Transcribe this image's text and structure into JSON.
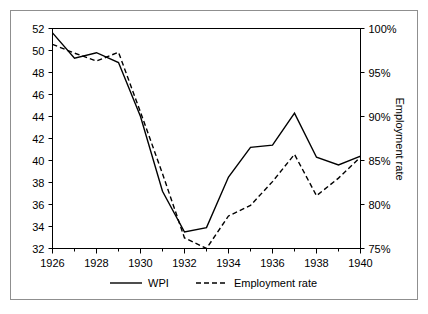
{
  "chart_data": {
    "type": "line",
    "title": "",
    "subtitle": "",
    "xlabel": "",
    "ylabel": "",
    "y2label": "Employment rate",
    "grid": false,
    "legend_position": "bottom",
    "x": [
      1926,
      1927,
      1928,
      1929,
      1930,
      1931,
      1932,
      1933,
      1934,
      1935,
      1936,
      1937,
      1938,
      1939,
      1940
    ],
    "xlim": [
      1926,
      1940
    ],
    "xticks": [
      1926,
      1928,
      1930,
      1932,
      1934,
      1936,
      1938,
      1940
    ],
    "xtick_labels": [
      "1926",
      "1928",
      "1930",
      "1932",
      "1934",
      "1936",
      "1938",
      "1940"
    ],
    "xminorticks": [
      1927,
      1929,
      1931,
      1933,
      1935,
      1937,
      1939
    ],
    "ylim": [
      32,
      52
    ],
    "yticks": [
      32,
      34,
      36,
      38,
      40,
      42,
      44,
      46,
      48,
      50,
      52
    ],
    "ytick_labels": [
      "32",
      "34",
      "36",
      "38",
      "40",
      "42",
      "44",
      "46",
      "48",
      "50",
      "52"
    ],
    "y2lim": [
      75,
      100
    ],
    "y2ticks": [
      75,
      80,
      85,
      90,
      95,
      100
    ],
    "y2tick_labels": [
      "75%",
      "80%",
      "85%",
      "90%",
      "95%",
      "100%"
    ],
    "series": [
      {
        "name": "WPI",
        "axis": "left",
        "style": "solid",
        "color": "#000000",
        "values": [
          51.6,
          49.3,
          49.8,
          48.9,
          44.0,
          37.2,
          33.5,
          33.9,
          38.5,
          41.2,
          41.4,
          44.3,
          40.3,
          39.6,
          40.4
        ]
      },
      {
        "name": "Employment rate",
        "axis": "right",
        "style": "dashed",
        "color": "#000000",
        "values": [
          98.2,
          97.2,
          96.3,
          97.3,
          90.5,
          83.5,
          76.2,
          75.0,
          78.7,
          79.9,
          82.6,
          85.7,
          81.0,
          83.0,
          85.4
        ]
      }
    ]
  },
  "legend": {
    "items": [
      {
        "label": "WPI",
        "style": "solid"
      },
      {
        "label": "Employment rate",
        "style": "dashed"
      }
    ]
  },
  "axes": {
    "right_title": "Employment rate"
  },
  "colors": {
    "line": "#000000",
    "frame": "#000000",
    "outer_border": "#8f8f8f",
    "background": "#ffffff"
  }
}
